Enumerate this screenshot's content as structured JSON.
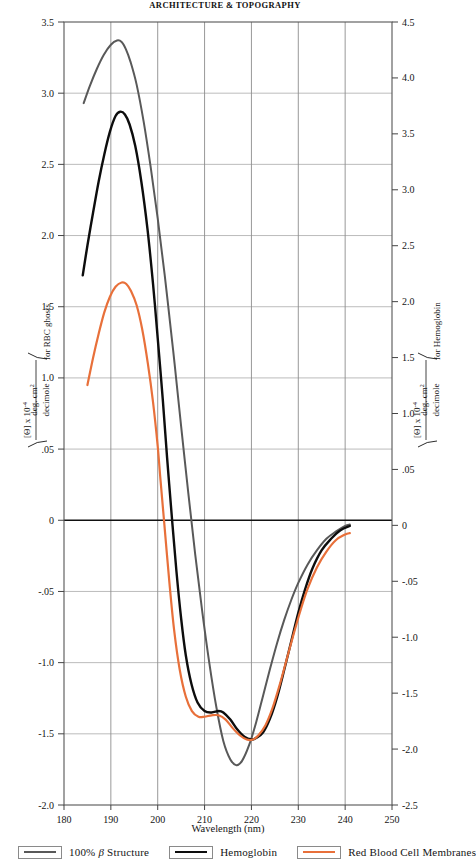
{
  "running_head": "ARCHITECTURE & TOPOGRAPHY",
  "figure": {
    "x_axis_caption": "Wavelength (nm)",
    "left_axis_title_prefix": "[Θ] x 10",
    "left_axis_title_exp": "-4",
    "left_axis_units_num": "deg. cm",
    "left_axis_units_num_exp": "2",
    "left_axis_units_den": "decimole",
    "left_axis_title_suffix": "for RBC ghosts",
    "right_axis_title_suffix": "for Hemoglobin"
  },
  "legend": {
    "items": [
      {
        "label_pre": "100% ",
        "label_beta": "β",
        "label_post": " Structure",
        "color": "#595959",
        "name": "beta-structure"
      },
      {
        "label_pre": "",
        "label_beta": "",
        "label_post": "Hemoglobin",
        "color": "#0d0d0d",
        "name": "hemoglobin"
      },
      {
        "label_pre": "",
        "label_beta": "",
        "label_post": "Red Blood Cell Membranes",
        "color": "#e8703a",
        "name": "red-blood-cell-membranes"
      }
    ]
  },
  "chart_data": {
    "type": "line",
    "title": "",
    "xlabel": "Wavelength (nm)",
    "ylabel": "[Θ] x 10-4 (deg. cm2 / decimole) for RBC ghosts",
    "ylabel_right": "[Θ] x 10-4 (deg. cm2 / decimole) for Hemoglobin",
    "xlim": [
      180,
      250
    ],
    "ylim": [
      -2.0,
      3.5
    ],
    "ylim_right": [
      -2.5,
      4.5
    ],
    "xticks": [
      180,
      190,
      200,
      210,
      220,
      230,
      240,
      250
    ],
    "xticklabels": [
      "180",
      "190",
      "200",
      "210",
      "220",
      "230",
      "240",
      "250"
    ],
    "yticks_left": [
      3.5,
      3.0,
      2.5,
      2.0,
      1.5,
      1.0,
      0.5,
      0,
      -0.5,
      -1.0,
      -1.5,
      -2.0
    ],
    "yticklabels_left": [
      "3.5",
      "3.0",
      "2.5",
      "2.0",
      "1.5",
      "1.0",
      ".05",
      "0",
      "-.05",
      "-1.0",
      "-1.5",
      "-2.0"
    ],
    "yticks_right": [
      4.5,
      4.0,
      3.5,
      3.0,
      2.5,
      2.0,
      1.5,
      1.0,
      0.5,
      0,
      -0.5,
      -1.0,
      -1.5,
      -2.0,
      -2.5
    ],
    "yticklabels_right": [
      "4.5",
      "4.0",
      "3.5",
      "3.0",
      "2.5",
      "2.0",
      "1.5",
      "1.0",
      ".05",
      "0",
      "-.05",
      "-1.0",
      "-1.5",
      "-2.0",
      "-2.5"
    ],
    "grid": true,
    "legend_position": "below",
    "zero_line": 0,
    "series": [
      {
        "name": "100% β Structure",
        "color": "#595959",
        "width": 2.0,
        "axis": "left",
        "points": [
          [
            184.2,
            2.93
          ],
          [
            185.5,
            3.05
          ],
          [
            187.0,
            3.17
          ],
          [
            188.5,
            3.27
          ],
          [
            190.0,
            3.34
          ],
          [
            191.3,
            3.37
          ],
          [
            192.3,
            3.36
          ],
          [
            193.2,
            3.31
          ],
          [
            194.2,
            3.22
          ],
          [
            195.5,
            3.06
          ],
          [
            197.0,
            2.8
          ],
          [
            198.5,
            2.48
          ],
          [
            200.0,
            2.12
          ],
          [
            201.5,
            1.72
          ],
          [
            203.0,
            1.28
          ],
          [
            203.6,
            1.1
          ],
          [
            205.0,
            0.66
          ],
          [
            206.5,
            0.2
          ],
          [
            208.0,
            -0.24
          ],
          [
            209.5,
            -0.64
          ],
          [
            211.0,
            -1.0
          ],
          [
            212.5,
            -1.31
          ],
          [
            214.0,
            -1.55
          ],
          [
            215.5,
            -1.68
          ],
          [
            216.8,
            -1.72
          ],
          [
            218.0,
            -1.69
          ],
          [
            219.5,
            -1.58
          ],
          [
            221.0,
            -1.42
          ],
          [
            222.5,
            -1.23
          ],
          [
            224.0,
            -1.04
          ],
          [
            225.5,
            -0.86
          ],
          [
            227.0,
            -0.7
          ],
          [
            228.5,
            -0.56
          ],
          [
            230.0,
            -0.44
          ],
          [
            232.0,
            -0.31
          ],
          [
            234.0,
            -0.21
          ],
          [
            236.0,
            -0.13
          ],
          [
            238.0,
            -0.08
          ],
          [
            240.0,
            -0.04
          ],
          [
            241.0,
            -0.03
          ]
        ]
      },
      {
        "name": "Hemoglobin",
        "color": "#0d0d0d",
        "width": 2.4,
        "axis": "left",
        "points": [
          [
            184.0,
            1.72
          ],
          [
            185.0,
            1.93
          ],
          [
            186.2,
            2.16
          ],
          [
            187.4,
            2.38
          ],
          [
            188.6,
            2.57
          ],
          [
            189.8,
            2.73
          ],
          [
            191.0,
            2.84
          ],
          [
            192.0,
            2.87
          ],
          [
            193.0,
            2.85
          ],
          [
            194.0,
            2.78
          ],
          [
            195.2,
            2.63
          ],
          [
            196.5,
            2.38
          ],
          [
            197.8,
            2.05
          ],
          [
            199.0,
            1.66
          ],
          [
            200.0,
            1.28
          ],
          [
            201.1,
            0.84
          ],
          [
            202.0,
            0.44
          ],
          [
            203.0,
            0.03
          ],
          [
            204.0,
            -0.36
          ],
          [
            205.0,
            -0.69
          ],
          [
            206.0,
            -0.95
          ],
          [
            207.2,
            -1.15
          ],
          [
            208.5,
            -1.28
          ],
          [
            210.0,
            -1.34
          ],
          [
            211.5,
            -1.35
          ],
          [
            213.0,
            -1.34
          ],
          [
            214.0,
            -1.35
          ],
          [
            215.5,
            -1.4
          ],
          [
            217.0,
            -1.47
          ],
          [
            218.5,
            -1.52
          ],
          [
            220.0,
            -1.54
          ],
          [
            221.0,
            -1.53
          ],
          [
            222.5,
            -1.49
          ],
          [
            224.0,
            -1.39
          ],
          [
            225.5,
            -1.24
          ],
          [
            227.0,
            -1.05
          ],
          [
            228.5,
            -0.85
          ],
          [
            230.0,
            -0.65
          ],
          [
            231.5,
            -0.48
          ],
          [
            233.0,
            -0.34
          ],
          [
            235.0,
            -0.21
          ],
          [
            237.0,
            -0.13
          ],
          [
            239.0,
            -0.07
          ],
          [
            241.0,
            -0.04
          ]
        ]
      },
      {
        "name": "Red Blood Cell Membranes",
        "color": "#e8703a",
        "width": 2.2,
        "axis": "left",
        "points": [
          [
            185.0,
            0.95
          ],
          [
            186.2,
            1.14
          ],
          [
            187.4,
            1.31
          ],
          [
            188.6,
            1.46
          ],
          [
            189.8,
            1.57
          ],
          [
            191.0,
            1.64
          ],
          [
            192.3,
            1.67
          ],
          [
            193.3,
            1.66
          ],
          [
            194.3,
            1.61
          ],
          [
            195.5,
            1.51
          ],
          [
            196.7,
            1.34
          ],
          [
            197.9,
            1.1
          ],
          [
            199.0,
            0.83
          ],
          [
            200.0,
            0.52
          ],
          [
            200.6,
            0.28
          ],
          [
            201.5,
            -0.06
          ],
          [
            202.5,
            -0.44
          ],
          [
            203.5,
            -0.77
          ],
          [
            204.7,
            -1.05
          ],
          [
            206.0,
            -1.24
          ],
          [
            207.3,
            -1.34
          ],
          [
            208.7,
            -1.38
          ],
          [
            210.0,
            -1.38
          ],
          [
            211.5,
            -1.37
          ],
          [
            213.0,
            -1.37
          ],
          [
            214.5,
            -1.4
          ],
          [
            216.0,
            -1.46
          ],
          [
            217.5,
            -1.51
          ],
          [
            219.0,
            -1.54
          ],
          [
            220.3,
            -1.54
          ],
          [
            221.5,
            -1.51
          ],
          [
            223.0,
            -1.44
          ],
          [
            224.5,
            -1.32
          ],
          [
            226.0,
            -1.16
          ],
          [
            227.5,
            -0.98
          ],
          [
            229.0,
            -0.8
          ],
          [
            230.5,
            -0.63
          ],
          [
            232.0,
            -0.48
          ],
          [
            234.0,
            -0.33
          ],
          [
            236.0,
            -0.22
          ],
          [
            238.0,
            -0.14
          ],
          [
            240.0,
            -0.1
          ],
          [
            241.0,
            -0.09
          ]
        ]
      }
    ]
  }
}
